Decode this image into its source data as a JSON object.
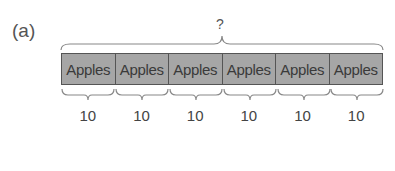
{
  "figure": {
    "panel_label": "(a)",
    "total_label": "?",
    "cells": [
      {
        "label": "Apples",
        "value": "10"
      },
      {
        "label": "Apples",
        "value": "10"
      },
      {
        "label": "Apples",
        "value": "10"
      },
      {
        "label": "Apples",
        "value": "10"
      },
      {
        "label": "Apples",
        "value": "10"
      },
      {
        "label": "Apples",
        "value": "10"
      }
    ],
    "colors": {
      "cell_fill": "#a6a6a6",
      "border": "#555555",
      "brace": "#888888"
    }
  }
}
